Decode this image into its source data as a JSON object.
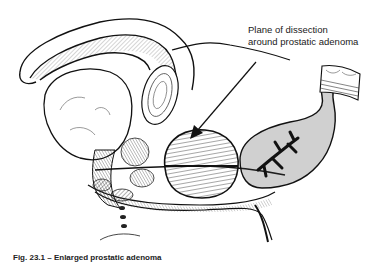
{
  "figure": {
    "type": "anatomical-line-illustration",
    "annotation": {
      "line1": "Plane of dissection",
      "line2": "around prostatic adenoma",
      "arrow_icon": "arrow-down-left-icon"
    },
    "caption": "Fig. 23.1 – Enlarged prostatic adenoma",
    "colors": {
      "ink": "#1a1a1a",
      "background": "#ffffff"
    }
  }
}
